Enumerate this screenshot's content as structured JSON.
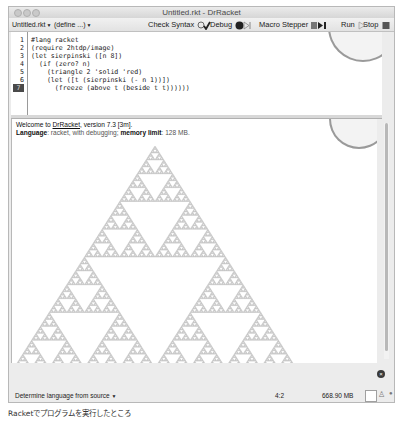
{
  "window": {
    "title": "Untitled.rkt - DrRacket",
    "traffic_lights": [
      "close",
      "minimize",
      "zoom"
    ]
  },
  "toolbar": {
    "file_menu": "Untitled.rkt",
    "define_menu": "(define ...)",
    "check_syntax": "Check Syntax",
    "debug": "Debug",
    "macro_stepper": "Macro Stepper",
    "run": "Run",
    "stop": "Stop"
  },
  "editor": {
    "lines": [
      {
        "num": "1",
        "code": "#lang racket"
      },
      {
        "num": "2",
        "code": "(require 2htdp/image)"
      },
      {
        "num": "3",
        "code": "(let sierpinski ([n 8])"
      },
      {
        "num": "4",
        "code": "  (if (zero? n)"
      },
      {
        "num": "5",
        "code": "    (triangle 2 'solid 'red)"
      },
      {
        "num": "6",
        "code": "    (let ([t (sierpinski (- n 1))])"
      },
      {
        "num": "7",
        "code": "      (freeze (above t (beside t t))))))"
      }
    ],
    "current_line": "7"
  },
  "interactions": {
    "welcome_prefix": "Welcome to ",
    "welcome_link": "DrRacket",
    "welcome_suffix": ", version 7.3 [3m].",
    "language_label": "Language",
    "language_value": ": racket, with debugging; ",
    "memory_label": "memory limit",
    "memory_value": ": 128 MB.",
    "output": {
      "type": "sierpinski-triangle",
      "order": 8,
      "color": "#a8a8a8"
    }
  },
  "statusbar": {
    "language_selector": "Determine language from source",
    "cursor_position": "4:2",
    "memory_usage": "668.90 MB"
  },
  "caption": "Racketでプログラムを実行したところ",
  "colors": {
    "window_bg": "#ececec",
    "editor_bg": "#ffffff",
    "current_line_bg": "#4a4a4a"
  }
}
